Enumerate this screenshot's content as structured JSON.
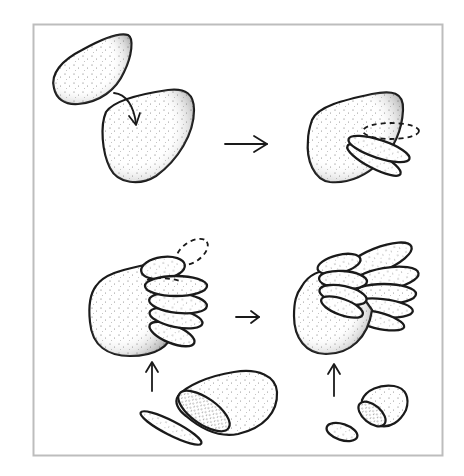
{
  "figure": {
    "frame": {
      "border_color": "#bdbdbd",
      "background": "#ffffff"
    },
    "colors": {
      "ink": "#1a1a1a",
      "stipple": "#555555"
    },
    "panels": [
      {
        "id": "step-1",
        "label": "",
        "content": "small clay lump pressed onto larger rounded base (curved arrow)"
      },
      {
        "id": "step-2",
        "label": "",
        "content": "base with first two flat oval feather pieces attached; dashed outline shows next piece position"
      },
      {
        "id": "step-3",
        "label": "",
        "content": "base with a stack of five oval feathers; dashed outline shows next piece; feathers are sliced from a rolled clay lump (arrow up)"
      },
      {
        "id": "step-4",
        "label": "",
        "content": "finished wing with two overlapping rows of feathers; smaller slices from a smaller lump (arrow up)"
      }
    ],
    "arrows": [
      {
        "id": "arrow-merge",
        "direction": "curved-down"
      },
      {
        "id": "arrow-step1-to-2",
        "direction": "right"
      },
      {
        "id": "arrow-step3-to-4",
        "direction": "right"
      },
      {
        "id": "arrow-slice-up-left",
        "direction": "up"
      },
      {
        "id": "arrow-slice-up-right",
        "direction": "up"
      }
    ]
  }
}
